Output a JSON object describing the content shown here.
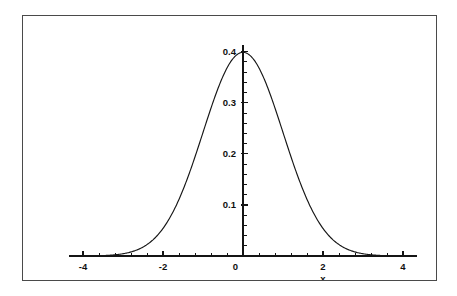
{
  "figure": {
    "background_color": "#ffffff",
    "frame_color": "#4a4a4a",
    "ink_color": "#141414"
  },
  "chart_data": {
    "type": "line",
    "title": "",
    "subtitle": "",
    "xlabel": "x",
    "ylabel": "",
    "xlim": [
      -4.35,
      4.35
    ],
    "ylim": [
      0,
      0.425
    ],
    "grid": false,
    "legend": null,
    "curve_name": "standard-normal-pdf",
    "function": "f(x) = (1/sqrt(2*pi)) * exp(-x^2/2)",
    "xticks": [
      -4,
      -2,
      0,
      2,
      4
    ],
    "xtick_labels": [
      "-4",
      "-2",
      "0",
      "2",
      "4"
    ],
    "xtick_minor_step": 0.4,
    "yticks": [
      0.1,
      0.2,
      0.3,
      0.4
    ],
    "ytick_labels": [
      "0.1",
      "0.2",
      "0.3",
      "0.4"
    ],
    "ytick_minor_step": 0.02,
    "x": [
      -4.0,
      -3.8,
      -3.6,
      -3.4,
      -3.2,
      -3.0,
      -2.8,
      -2.6,
      -2.4,
      -2.2,
      -2.0,
      -1.8,
      -1.6,
      -1.4,
      -1.2,
      -1.0,
      -0.8,
      -0.6,
      -0.4,
      -0.2,
      0.0,
      0.2,
      0.4,
      0.6,
      0.8,
      1.0,
      1.2,
      1.4,
      1.6,
      1.8,
      2.0,
      2.2,
      2.4,
      2.6,
      2.8,
      3.0,
      3.2,
      3.4,
      3.6,
      3.8,
      4.0
    ],
    "y": [
      0.0001,
      0.0003,
      0.0006,
      0.0012,
      0.0024,
      0.0044,
      0.0079,
      0.0136,
      0.0224,
      0.0355,
      0.054,
      0.079,
      0.1109,
      0.1497,
      0.1942,
      0.242,
      0.2897,
      0.3332,
      0.3683,
      0.391,
      0.3989,
      0.391,
      0.3683,
      0.3332,
      0.2897,
      0.242,
      0.1942,
      0.1497,
      0.1109,
      0.079,
      0.054,
      0.0355,
      0.0224,
      0.0136,
      0.0079,
      0.0044,
      0.0024,
      0.0012,
      0.0006,
      0.0003,
      0.0001
    ],
    "peak": {
      "x": 0.0,
      "y": 0.3989
    }
  }
}
